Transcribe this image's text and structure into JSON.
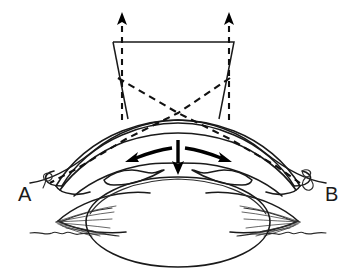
{
  "figure": {
    "type": "line-drawing",
    "background_color": "#ffffff",
    "line_color": "#1a1a1a",
    "canvas": {
      "width": 362,
      "height": 278
    }
  },
  "labels": {
    "left": "A",
    "right": "B",
    "left_position": {
      "x": 18,
      "y": 201
    },
    "right_position": {
      "x": 325,
      "y": 201
    }
  },
  "instrument": {
    "name": "trapezoid-instrument",
    "description": "Trapezoidal tool tapering downward toward cornea",
    "top_left": {
      "x": 113,
      "y": 42
    },
    "top_right": {
      "x": 234,
      "y": 42
    },
    "bottom_left": {
      "x": 128,
      "y": 119
    },
    "bottom_right": {
      "x": 219,
      "y": 119
    },
    "stroke_width": 1.5
  },
  "traction_arrows": {
    "name": "dashed-up-arrows",
    "count": 2,
    "direction": "up",
    "style": "dashed",
    "left": {
      "x": 122,
      "tail_y": 120,
      "tip_y": 13
    },
    "right": {
      "x": 229,
      "tail_y": 120,
      "tip_y": 13
    }
  },
  "projection_lines": {
    "name": "dashed-diagonals",
    "style": "dashed",
    "crossing_point": {
      "x": 178,
      "y": 113
    },
    "left_origin": {
      "x": 118,
      "y": 78
    },
    "right_origin": {
      "x": 230,
      "y": 78
    },
    "left_terminus": {
      "x": 50,
      "y": 183
    },
    "right_terminus": {
      "x": 300,
      "y": 183
    }
  },
  "flow_arrows": [
    {
      "name": "arrow-left",
      "direction": "left",
      "from": {
        "x": 178,
        "y": 150
      },
      "to": {
        "x": 128,
        "y": 160
      }
    },
    {
      "name": "arrow-down",
      "direction": "down",
      "from": {
        "x": 178,
        "y": 142
      },
      "to": {
        "x": 178,
        "y": 172
      }
    },
    {
      "name": "arrow-right",
      "direction": "right",
      "from": {
        "x": 180,
        "y": 150
      },
      "to": {
        "x": 231,
        "y": 161
      }
    }
  ],
  "anatomy": {
    "lens": {
      "name": "lens-ellipse",
      "center": {
        "x": 178,
        "y": 222
      },
      "radius_x": 92,
      "radius_y": 45
    },
    "cornea": {
      "name": "cornea-arc",
      "apex": {
        "x": 178,
        "y": 121
      }
    },
    "sclera": {
      "name": "sclera-outer-contour"
    },
    "ciliary_body_left": {
      "name": "ciliary-body-left"
    },
    "ciliary_body_right": {
      "name": "ciliary-body-right"
    },
    "zonules_left": {
      "name": "zonule-fibers-left",
      "fiber_count": 7
    },
    "zonules_right": {
      "name": "zonule-fibers-right",
      "fiber_count": 7
    },
    "droplet_left": {
      "name": "droplet-marker-left",
      "x": 48,
      "y": 177
    },
    "droplet_right": {
      "name": "droplet-marker-right",
      "x": 306,
      "y": 178
    }
  }
}
